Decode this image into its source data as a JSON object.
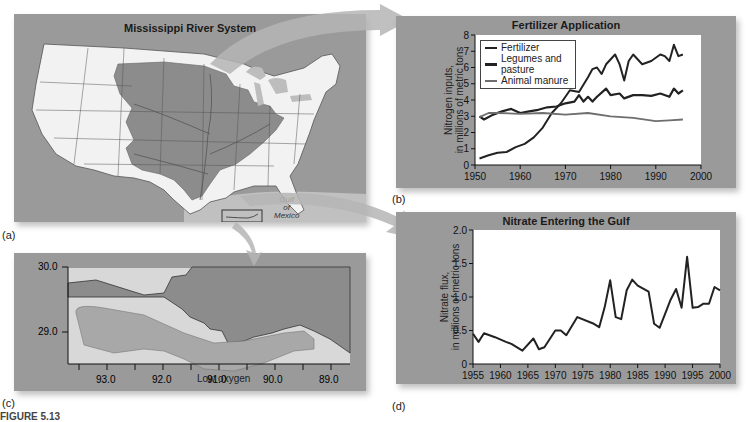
{
  "panels": {
    "a": {
      "label": "(a)",
      "title": "Mississippi River System",
      "gulf_label": [
        "Gulf",
        "of",
        "Mexico"
      ]
    },
    "b": {
      "label": "(b)"
    },
    "c": {
      "label": "(c)",
      "zone_label": "Low oxygen",
      "y_ticks": [
        "30.0",
        "29.0"
      ],
      "x_ticks": [
        "93.0",
        "92.0",
        "91.0",
        "90.0",
        "89.0"
      ]
    },
    "d": {
      "label": "(d)"
    }
  },
  "caption": "FIGURE 5.13",
  "colors": {
    "panel_bg": "#9a9a9a",
    "basin": "#8c8c8c",
    "land": "#f2f2f2",
    "water": "#c8c8c8",
    "line_dark": "#222222",
    "line_manure": "#6e6e6e",
    "hypoxia": "#a8a8a8"
  },
  "chart_data": [
    {
      "type": "line",
      "title": "Fertilizer Application",
      "xlabel": "",
      "ylabel": "Nitrogen inputs, in millions of metric tons",
      "ylabel_lines": [
        "Nitrogen inputs,",
        "in millions of metric tons"
      ],
      "xlim": [
        1950,
        2000
      ],
      "ylim": [
        0,
        8
      ],
      "x_ticks": [
        1950,
        1960,
        1970,
        1980,
        1990,
        2000
      ],
      "y_ticks": [
        0,
        1,
        2,
        3,
        4,
        5,
        6,
        7,
        8
      ],
      "legend": [
        "Fertilizer",
        "Legumes and pasture",
        "Animal manure"
      ],
      "legend_position": "upper left",
      "grid": false,
      "series": [
        {
          "name": "Fertilizer",
          "color": "#222222",
          "x": [
            1951,
            1953,
            1955,
            1957,
            1959,
            1961,
            1963,
            1965,
            1967,
            1969,
            1971,
            1973,
            1975,
            1976,
            1977,
            1978,
            1979,
            1981,
            1982,
            1983,
            1984,
            1985,
            1987,
            1989,
            1991,
            1992,
            1993,
            1994,
            1995,
            1996
          ],
          "values": [
            0.4,
            0.6,
            0.75,
            0.8,
            1.1,
            1.3,
            1.7,
            2.3,
            3.2,
            3.8,
            4.6,
            4.5,
            5.4,
            5.9,
            6.0,
            5.6,
            6.2,
            6.8,
            6.2,
            5.2,
            6.4,
            6.8,
            6.2,
            6.4,
            6.8,
            6.7,
            6.4,
            7.4,
            6.7,
            6.8
          ]
        },
        {
          "name": "Legumes and pasture",
          "color": "#222222",
          "x": [
            1951,
            1952,
            1954,
            1956,
            1958,
            1960,
            1962,
            1964,
            1966,
            1968,
            1970,
            1972,
            1973,
            1974,
            1975,
            1976,
            1977,
            1979,
            1980,
            1982,
            1983,
            1985,
            1987,
            1989,
            1991,
            1993,
            1994,
            1995,
            1996
          ],
          "values": [
            3.0,
            2.8,
            3.1,
            3.3,
            3.45,
            3.2,
            3.3,
            3.4,
            3.55,
            3.6,
            3.8,
            3.9,
            4.3,
            3.9,
            4.2,
            3.9,
            4.2,
            4.7,
            4.3,
            4.4,
            4.1,
            4.3,
            4.3,
            4.25,
            4.4,
            4.2,
            4.7,
            4.4,
            4.6
          ]
        },
        {
          "name": "Animal manure",
          "color": "#6e6e6e",
          "x": [
            1951,
            1953,
            1955,
            1960,
            1965,
            1970,
            1975,
            1980,
            1985,
            1990,
            1993,
            1996
          ],
          "values": [
            2.95,
            3.2,
            3.2,
            3.15,
            3.2,
            3.1,
            3.2,
            3.0,
            2.9,
            2.7,
            2.75,
            2.8
          ]
        }
      ]
    },
    {
      "type": "line",
      "title": "Nitrate Entering the Gulf",
      "xlabel": "",
      "ylabel": "Nitrate flux, in millions of metric tons",
      "ylabel_lines": [
        "Nitrate flux,",
        "in millions of metric tons"
      ],
      "xlim": [
        1955,
        2000
      ],
      "ylim": [
        0,
        2.0
      ],
      "x_ticks": [
        1955,
        1960,
        1965,
        1970,
        1975,
        1980,
        1985,
        1990,
        1995,
        2000
      ],
      "y_ticks": [
        "0",
        "0.5",
        "1.0",
        "1.5",
        "2.0"
      ],
      "grid": false,
      "series": [
        {
          "name": "Nitrate flux",
          "color": "#222222",
          "x": [
            1955,
            1956,
            1957,
            1959,
            1961,
            1962,
            1964,
            1966,
            1967,
            1968,
            1970,
            1971,
            1972,
            1974,
            1977,
            1978,
            1979,
            1980,
            1981,
            1982,
            1983,
            1984,
            1985,
            1987,
            1988,
            1989,
            1990,
            1991,
            1992,
            1993,
            1994,
            1995,
            1996,
            1997,
            1998,
            1999,
            2000
          ],
          "values": [
            0.45,
            0.33,
            0.46,
            0.4,
            0.33,
            0.3,
            0.2,
            0.38,
            0.22,
            0.25,
            0.5,
            0.5,
            0.43,
            0.7,
            0.6,
            0.55,
            0.85,
            1.25,
            0.7,
            0.67,
            1.1,
            1.26,
            1.17,
            1.08,
            0.6,
            0.54,
            0.75,
            0.96,
            1.12,
            0.84,
            1.6,
            0.84,
            0.85,
            0.9,
            0.9,
            1.15,
            1.1
          ]
        }
      ]
    }
  ]
}
